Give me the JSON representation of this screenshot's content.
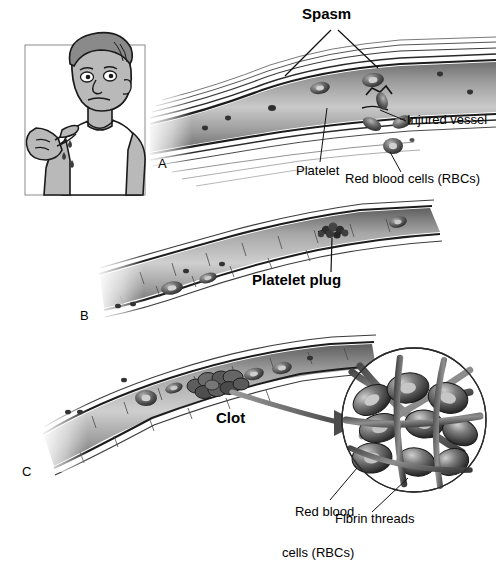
{
  "figure": {
    "title_implicit": "Hemostasis: stages of blood clotting",
    "palette": {
      "ink": "#000000",
      "vessel_dark": "#3a3a3a",
      "vessel_mid": "#8e8e8e",
      "vessel_light": "#d8d8d8",
      "skin": "#b9b9b9",
      "hair": "#8a8a8a",
      "shirt": "#ffffff",
      "background": "#ffffff"
    }
  },
  "panels": [
    {
      "letter": "A",
      "name": "vascular-spasm"
    },
    {
      "letter": "B",
      "name": "platelet-plug-formation"
    },
    {
      "letter": "C",
      "name": "coagulation-clot"
    }
  ],
  "labels": {
    "spasm": "Spasm",
    "platelet": "Platelet",
    "injured_vessel": "Injured vessel",
    "rbc_panel_a": "Red blood cells (RBCs)",
    "platelet_plug": "Platelet plug",
    "clot": "Clot",
    "rbc_inset_line1": "Red blood",
    "rbc_inset_line2": "cells (RBCs)",
    "fibrin_threads": "Fibrin threads"
  },
  "inset": {
    "name": "clot-magnification",
    "contents": "red blood cells enmeshed in fibrin threads",
    "rbc_count": 9,
    "fibrin_thread_count": 7
  },
  "person": {
    "name": "man-with-cut-finger",
    "blood_drop_count": 3,
    "gesture": "pointing at bleeding finger"
  }
}
